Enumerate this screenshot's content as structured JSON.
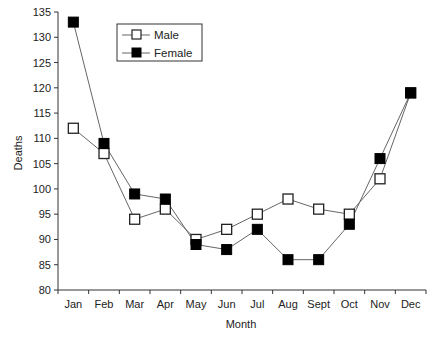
{
  "chart_data": {
    "type": "line",
    "title": "",
    "xlabel": "Month",
    "ylabel": "Deaths",
    "categories": [
      "Jan",
      "Feb",
      "Mar",
      "Apr",
      "May",
      "Jun",
      "Jul",
      "Aug",
      "Sept",
      "Oct",
      "Nov",
      "Dec"
    ],
    "series": [
      {
        "name": "Male",
        "marker": "open-square",
        "values": [
          112,
          107,
          94,
          96,
          90,
          92,
          95,
          98,
          96,
          95,
          102,
          119
        ]
      },
      {
        "name": "Female",
        "marker": "filled-square",
        "values": [
          133,
          109,
          99,
          98,
          89,
          88,
          92,
          86,
          86,
          93,
          106,
          119
        ]
      }
    ],
    "ylim": [
      80,
      135
    ],
    "yticks": [
      80,
      85,
      90,
      95,
      100,
      105,
      110,
      115,
      120,
      125,
      130,
      135
    ],
    "grid": false,
    "legend_position": "upper-left-inside"
  },
  "legend": {
    "items": [
      {
        "label": "Male"
      },
      {
        "label": "Female"
      }
    ]
  },
  "colors": {
    "line": "#666666",
    "marker_fill_female": "#000000",
    "marker_fill_male": "#ffffff",
    "axis": "#333333"
  }
}
